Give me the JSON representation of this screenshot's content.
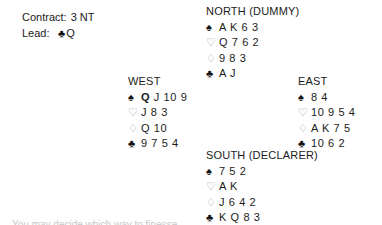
{
  "contract": {
    "contract_label": "Contract:",
    "contract_value": "3 NT",
    "lead_label": "Lead:",
    "lead_suit_symbol": "♣",
    "lead_suit_name": "club",
    "lead_rank": "Q"
  },
  "suits": {
    "spade_symbol": "♠",
    "heart_symbol": "♡",
    "diamond_symbol": "♢",
    "club_symbol": "♣"
  },
  "colors": {
    "text": "#1b1b1b",
    "black_suit": "#111111",
    "red_suit_outline": "#9a9a9a",
    "background": "#ffffff"
  },
  "hands": {
    "north": {
      "label": "NORTH (DUMMY)",
      "spades": "A K 6 3",
      "hearts": "Q 7 6 2",
      "diamonds": "9 8 3",
      "clubs": "A J"
    },
    "west": {
      "label": "WEST",
      "spades_highlight": "Q",
      "spades_rest": "J 10 9",
      "hearts": "J 8 3",
      "diamonds": "Q 10",
      "clubs": "9 7 5 4"
    },
    "east": {
      "label": "EAST",
      "spades": "8 4",
      "hearts": "10 9 5 4",
      "diamonds": "A K 7 5",
      "clubs": "10 6 2"
    },
    "south": {
      "label": "SOUTH (DECLARER)",
      "spades": "7 5 2",
      "hearts": "A K",
      "diamonds": "J 6 4 2",
      "clubs": "K Q 8 3"
    }
  },
  "bottom_clipped_text": "You may decide which way to finesse"
}
